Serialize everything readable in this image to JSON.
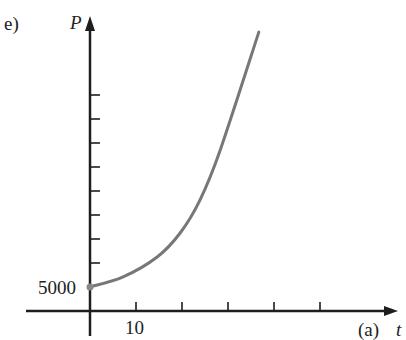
{
  "panel_label": "e)",
  "chart_data": {
    "type": "line",
    "title": "",
    "xlabel": "t",
    "ylabel": "P",
    "axis_note": "(a)",
    "x_tick_labels": [
      "10"
    ],
    "x_ticks": [
      10,
      20,
      30,
      40,
      50
    ],
    "y_tick_labels": [
      "5000"
    ],
    "y_ticks": [
      10000,
      15000,
      20000,
      25000,
      30000,
      35000,
      40000,
      45000
    ],
    "xlim": [
      0,
      67
    ],
    "ylim": [
      0,
      58000
    ],
    "grid": false,
    "legend": null,
    "initial_point": {
      "t": 0,
      "P": 5000
    },
    "series": [
      {
        "name": "P(t)",
        "color": "#777777",
        "x": [
          0,
          7.2,
          14.6,
          19.6,
          23.9,
          28.3,
          36.7
        ],
        "values": [
          5000,
          7100,
          11250,
          16250,
          23100,
          33500,
          58100
        ]
      }
    ]
  },
  "colors": {
    "axis": "#1e1e1e",
    "curve": "#777777",
    "point": "#888888"
  }
}
